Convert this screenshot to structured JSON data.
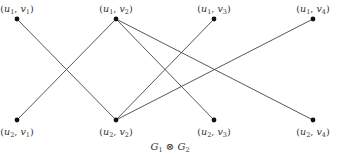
{
  "diagram": {
    "caption": {
      "left": "G",
      "left_sub": "1",
      "op": "⊗",
      "right": "G",
      "right_sub": "2",
      "x": 170,
      "y": 142
    },
    "colors": {
      "edge": "#444444",
      "node": "#111111",
      "text": "#333333"
    },
    "node_radius": 2.4,
    "nodes": [
      {
        "id": "u1v1",
        "u": "u",
        "u_sub": "1",
        "v": "v",
        "v_sub": "1",
        "x": 17,
        "y": 19,
        "label_pos": "above"
      },
      {
        "id": "u1v2",
        "u": "u",
        "u_sub": "1",
        "v": "v",
        "v_sub": "2",
        "x": 116,
        "y": 19,
        "label_pos": "above"
      },
      {
        "id": "u1v3",
        "u": "u",
        "u_sub": "1",
        "v": "v",
        "v_sub": "3",
        "x": 214,
        "y": 19,
        "label_pos": "above"
      },
      {
        "id": "u1v4",
        "u": "u",
        "u_sub": "1",
        "v": "v",
        "v_sub": "4",
        "x": 313,
        "y": 19,
        "label_pos": "above"
      },
      {
        "id": "u2v1",
        "u": "u",
        "u_sub": "2",
        "v": "v",
        "v_sub": "1",
        "x": 17,
        "y": 120,
        "label_pos": "below"
      },
      {
        "id": "u2v2",
        "u": "u",
        "u_sub": "2",
        "v": "v",
        "v_sub": "2",
        "x": 116,
        "y": 120,
        "label_pos": "below"
      },
      {
        "id": "u2v3",
        "u": "u",
        "u_sub": "2",
        "v": "v",
        "v_sub": "3",
        "x": 214,
        "y": 120,
        "label_pos": "below"
      },
      {
        "id": "u2v4",
        "u": "u",
        "u_sub": "2",
        "v": "v",
        "v_sub": "4",
        "x": 313,
        "y": 120,
        "label_pos": "below"
      }
    ],
    "edges": [
      [
        "u1v1",
        "u2v2"
      ],
      [
        "u1v2",
        "u2v1"
      ],
      [
        "u1v2",
        "u2v3"
      ],
      [
        "u1v2",
        "u2v4"
      ],
      [
        "u1v3",
        "u2v2"
      ],
      [
        "u1v4",
        "u2v2"
      ]
    ]
  }
}
